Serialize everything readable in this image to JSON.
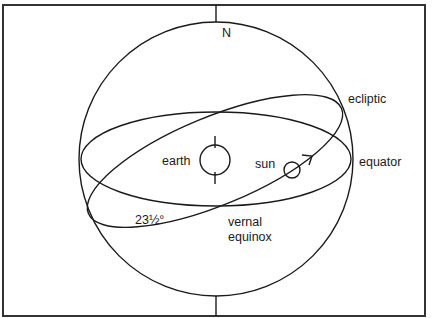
{
  "diagram": {
    "type": "celestial-sphere",
    "labels": {
      "north": "N",
      "ecliptic": "ecliptic",
      "equator": "equator",
      "earth": "earth",
      "sun": "sun",
      "tilt_angle": "23½°",
      "vernal_line1": "vernal",
      "vernal_line2": "equinox"
    },
    "colors": {
      "stroke": "#1a1a1a",
      "frame": "#333333",
      "background": "#ffffff"
    }
  }
}
